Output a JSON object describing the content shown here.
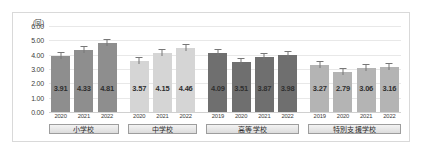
{
  "chart_data": {
    "type": "bar",
    "title": "",
    "xlabel": "",
    "ylabel": "(回)",
    "ylim": [
      0,
      6
    ],
    "ytick_labels": [
      "6.00",
      "5.00",
      "4.00",
      "3.00",
      "2.00",
      "1.00",
      "0.00"
    ],
    "ytick_values": [
      6,
      5,
      4,
      3,
      2,
      1,
      0
    ],
    "grid": true,
    "legend": "none",
    "groups": [
      {
        "name": "小学校",
        "color": "#8e8e8e",
        "categories": [
          "2020",
          "2021",
          "2022"
        ],
        "values": [
          3.91,
          4.33,
          4.81
        ],
        "labels": [
          "3.91",
          "4.33",
          "4.81"
        ]
      },
      {
        "name": "中学校",
        "color": "#d5d5d5",
        "categories": [
          "2020",
          "2021",
          "2022"
        ],
        "values": [
          3.57,
          4.15,
          4.46
        ],
        "labels": [
          "3.57",
          "4.15",
          "4.46"
        ]
      },
      {
        "name": "高等学校",
        "color": "#6f6f6f",
        "categories": [
          "2019",
          "2020",
          "2021",
          "2022"
        ],
        "values": [
          4.09,
          3.51,
          3.87,
          3.98
        ],
        "labels": [
          "4.09",
          "3.51",
          "3.87",
          "3.98"
        ]
      },
      {
        "name": "特別支援学校",
        "color": "#b4b4b4",
        "categories": [
          "2019",
          "2020",
          "2021",
          "2022"
        ],
        "values": [
          3.27,
          2.79,
          3.06,
          3.16
        ],
        "labels": [
          "3.27",
          "2.79",
          "3.06",
          "3.16"
        ]
      }
    ]
  }
}
